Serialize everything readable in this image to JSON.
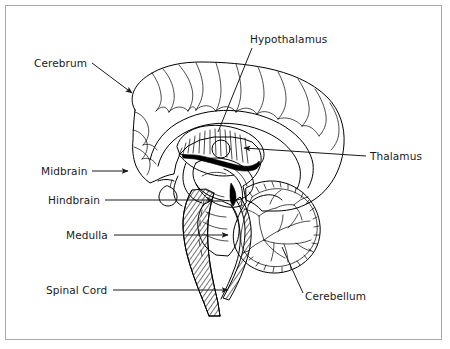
{
  "figure": {
    "background_color": "#ffffff",
    "frame_color": "#a8a8a8",
    "line_color": "#000000",
    "text_color": "#1a1a1a"
  },
  "labels": [
    {
      "id": "cerebrum",
      "text": "Cerebrum",
      "x": 34,
      "y": 67,
      "anchor": "start",
      "leader": {
        "x1": 92,
        "y1": 63,
        "x2": 132,
        "y2": 93
      },
      "arrow": true
    },
    {
      "id": "hypothalamus",
      "text": "Hypothalamus",
      "x": 250,
      "y": 43,
      "anchor": "start",
      "leader": {
        "x1": 252,
        "y1": 48,
        "x2": 218,
        "y2": 132
      },
      "arrow": false
    },
    {
      "id": "thalamus",
      "text": "Thalamus",
      "x": 370,
      "y": 160,
      "anchor": "start",
      "leader": {
        "x1": 366,
        "y1": 156,
        "x2": 244,
        "y2": 148
      },
      "arrow": true
    },
    {
      "id": "midbrain",
      "text": "Midbrain",
      "x": 41,
      "y": 175,
      "anchor": "start",
      "leader": {
        "x1": 92,
        "y1": 171,
        "x2": 128,
        "y2": 171
      },
      "arrow": true
    },
    {
      "id": "hindbrain",
      "text": "Hindbrain",
      "x": 48,
      "y": 204,
      "anchor": "start",
      "leader": {
        "x1": 105,
        "y1": 200,
        "x2": 213,
        "y2": 200
      },
      "arrow": true
    },
    {
      "id": "medulla",
      "text": "Medulla",
      "x": 66,
      "y": 239,
      "anchor": "start",
      "leader": {
        "x1": 114,
        "y1": 235,
        "x2": 228,
        "y2": 235
      },
      "arrow": true
    },
    {
      "id": "spinal-cord",
      "text": "Spinal Cord",
      "x": 46,
      "y": 294,
      "anchor": "start",
      "leader": {
        "x1": 113,
        "y1": 290,
        "x2": 228,
        "y2": 290
      },
      "arrow": true
    },
    {
      "id": "cerebellum",
      "text": "Cerebellum",
      "x": 305,
      "y": 300,
      "anchor": "start",
      "leader": {
        "x1": 303,
        "y1": 293,
        "x2": 282,
        "y2": 247
      },
      "arrow": false
    }
  ],
  "structures": [
    {
      "id": "cerebrum-cortex",
      "name": "cerebrum"
    },
    {
      "id": "corpus-callosum",
      "name": "corpus callosum"
    },
    {
      "id": "thalamus-body",
      "name": "thalamus"
    },
    {
      "id": "hypothalamus-body",
      "name": "hypothalamus"
    },
    {
      "id": "midbrain-body",
      "name": "midbrain"
    },
    {
      "id": "pons-body",
      "name": "pons / hindbrain"
    },
    {
      "id": "medulla-body",
      "name": "medulla oblongata"
    },
    {
      "id": "spinal-cord-body",
      "name": "spinal cord"
    },
    {
      "id": "cerebellum-body",
      "name": "cerebellum"
    }
  ]
}
